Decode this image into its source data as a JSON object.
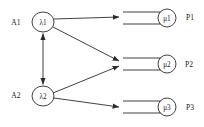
{
  "diagram": {
    "colors": {
      "stroke": "#2b2b2b",
      "background": "#ffffff",
      "text": "#1a1a1a"
    },
    "sources": [
      {
        "id": "A1",
        "label": "A1",
        "x": 16,
        "y": 22
      },
      {
        "id": "A2",
        "label": "A2",
        "x": 16,
        "y": 95
      }
    ],
    "router_nodes": [
      {
        "id": "lambda1",
        "label": "λ1",
        "cx": 43,
        "cy": 22,
        "rx": 11,
        "ry": 10
      },
      {
        "id": "lambda2",
        "label": "λ2",
        "cx": 43,
        "cy": 96,
        "rx": 11,
        "ry": 10
      }
    ],
    "queues": [
      {
        "id": "P1",
        "station_label": "P1",
        "server_label": "μ1",
        "station_x": 190,
        "station_y": 17,
        "server_cx": 167,
        "server_cy": 18,
        "server_r": 9,
        "queue_x1": 123,
        "queue_x2": 160,
        "queue_top_y": 12,
        "queue_bottom_y": 24
      },
      {
        "id": "P2",
        "station_label": "P2",
        "server_label": "μ2",
        "station_x": 189,
        "station_y": 64,
        "server_cx": 167,
        "server_cy": 64,
        "server_r": 9,
        "queue_x1": 123,
        "queue_x2": 160,
        "queue_top_y": 58,
        "queue_bottom_y": 70
      },
      {
        "id": "P3",
        "station_label": "P3",
        "server_label": "μ3",
        "station_x": 190,
        "station_y": 107,
        "server_cx": 167,
        "server_cy": 107,
        "server_r": 9,
        "queue_x1": 123,
        "queue_x2": 160,
        "queue_top_y": 101,
        "queue_bottom_y": 113
      }
    ],
    "edges": [
      {
        "id": "lambda1-to-P1",
        "from": "lambda1",
        "to": "P1",
        "arrowheads": 1
      },
      {
        "id": "lambda1-to-P2",
        "from": "lambda1",
        "to": "P2",
        "arrowheads": 1
      },
      {
        "id": "lambda2-to-P2",
        "from": "lambda2",
        "to": "P2",
        "arrowheads": 1
      },
      {
        "id": "lambda2-to-P3",
        "from": "lambda2",
        "to": "P3",
        "arrowheads": 1
      },
      {
        "id": "lambda1-lambda2-link",
        "from": "lambda1",
        "to": "lambda2",
        "arrowheads": 2,
        "bidirectional": true
      }
    ]
  }
}
